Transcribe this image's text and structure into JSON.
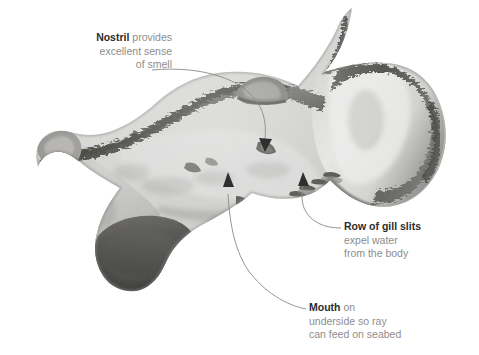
{
  "figure": {
    "background_color": "#ffffff",
    "heading_color": "#2c2c2c",
    "body_text_color": "#8d8d8d",
    "leader_line_color": "#8a8a8a"
  },
  "callouts": [
    {
      "id": "nostril",
      "heading": "Nostril",
      "lines": [
        "provides",
        "excellent sense",
        "of smell"
      ],
      "align": "right",
      "target": "nostril-marking"
    },
    {
      "id": "gill",
      "heading": "Row of gill slits",
      "lines": [
        "expel water",
        "from the body"
      ],
      "align": "left",
      "target": "gill-slits"
    },
    {
      "id": "mouth",
      "heading": "Mouth",
      "lines": [
        "on",
        "underside so ray",
        "can feed on seabed"
      ],
      "align": "left",
      "target": "mouth-opening"
    }
  ],
  "nostril_text": {
    "heading": "Nostril",
    "line1_tail": " provides",
    "line2": "excellent sense",
    "line3": "of smell"
  },
  "gill_text": {
    "heading": "Row of gill slits",
    "line2": "expel water",
    "line3": "from the body"
  },
  "mouth_text": {
    "heading": "Mouth",
    "line1_tail": " on",
    "line2": "underside so ray",
    "line3": "can feed on seabed"
  }
}
